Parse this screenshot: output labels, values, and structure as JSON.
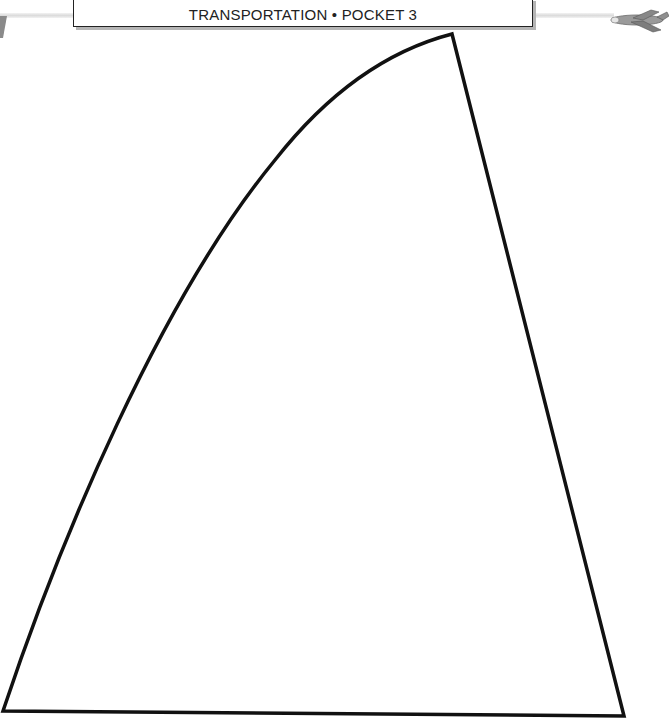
{
  "header": {
    "title": "TRANSPORTATION • POCKET 3"
  },
  "decorations": {
    "right_icon": "airplane-icon",
    "left_icon": "corner-mark-icon"
  },
  "template": {
    "shape": "curved-triangle-sail-outline",
    "stroke_color": "#111111",
    "fill_color": "#ffffff"
  }
}
